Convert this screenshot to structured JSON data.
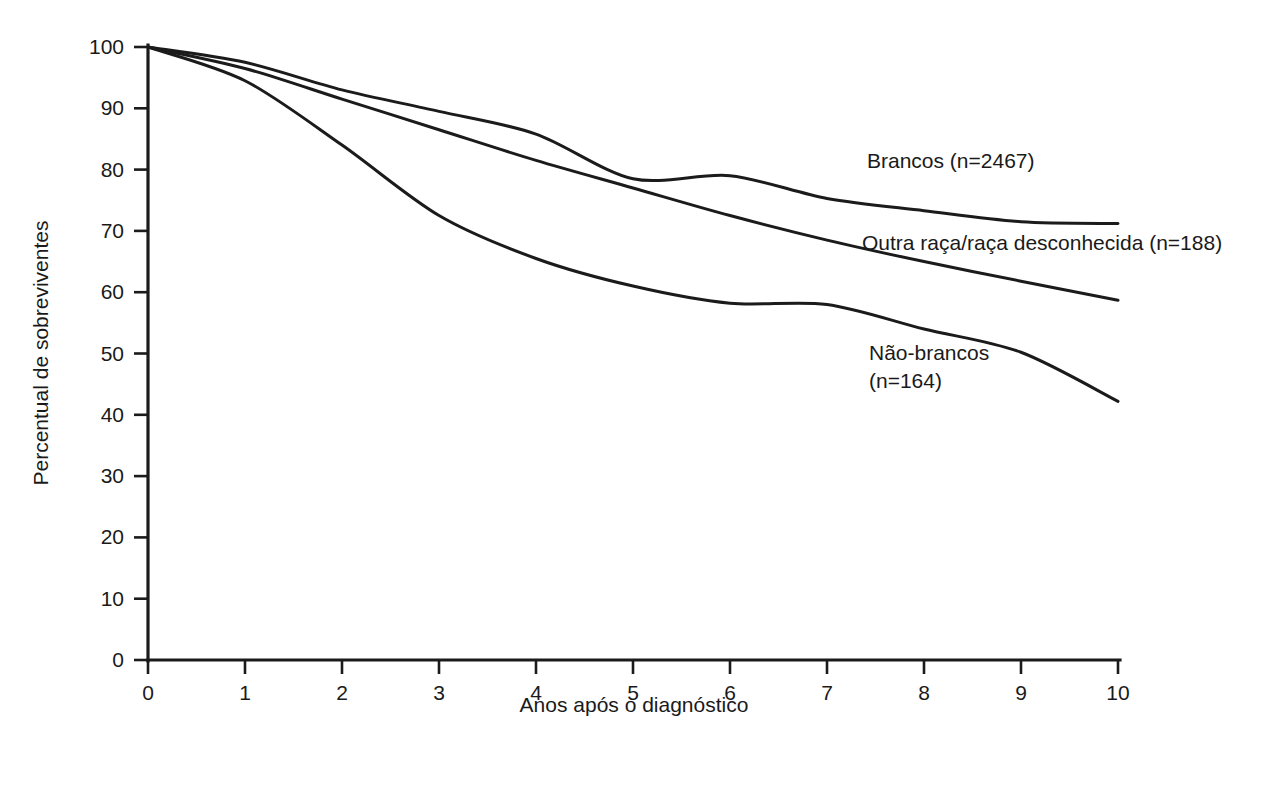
{
  "chart_data": {
    "type": "line",
    "title": "",
    "xlabel": "Anos após o diagnóstico",
    "ylabel": "Percentual de sobreviventes",
    "xlim": [
      0,
      10
    ],
    "ylim": [
      0,
      100
    ],
    "grid": false,
    "legend_position": "inline-annotations",
    "x_ticks": [
      "0",
      "1",
      "2",
      "3",
      "4",
      "5",
      "6",
      "7",
      "8",
      "9",
      "10"
    ],
    "y_ticks": [
      "0",
      "10",
      "20",
      "30",
      "40",
      "50",
      "60",
      "70",
      "80",
      "90",
      "100"
    ],
    "line_color": "#1b1b1b",
    "x": [
      0,
      1,
      2,
      3,
      4,
      5,
      6,
      7,
      8,
      9,
      10
    ],
    "series": [
      {
        "name": "Brancos (n=2467)",
        "label_line1": "Brancos (n=2467)",
        "label_line2": "",
        "values": [
          100,
          97.5,
          93.0,
          89.5,
          85.8,
          78.5,
          79.0,
          75.3,
          73.3,
          71.5,
          71.2
        ]
      },
      {
        "name": "Outra raça/raça desconhecida (n=188)",
        "label_line1": "Outra raça/raça desconhecida (n=188)",
        "label_line2": "",
        "values": [
          100,
          96.5,
          91.5,
          86.5,
          81.5,
          77.0,
          72.5,
          68.5,
          65.0,
          61.8,
          58.7
        ]
      },
      {
        "name": "Não-brancos (n=164)",
        "label_line1": "Não-brancos",
        "label_line2": "(n=164)",
        "values": [
          100,
          94.5,
          84.0,
          72.5,
          65.5,
          61.0,
          58.2,
          58.0,
          54.0,
          50.2,
          42.2
        ]
      }
    ],
    "annotations": [
      {
        "text": "Brancos (n=2467)",
        "x_px": 867,
        "y_px": 168
      },
      {
        "text": "Outra raça/raça desconhecida (n=188)",
        "x_px": 862,
        "y_px": 250
      },
      {
        "text": "Não-brancos",
        "x_px": 869,
        "y_px": 360
      },
      {
        "text": "(n=164)",
        "x_px": 869,
        "y_px": 388
      }
    ]
  }
}
